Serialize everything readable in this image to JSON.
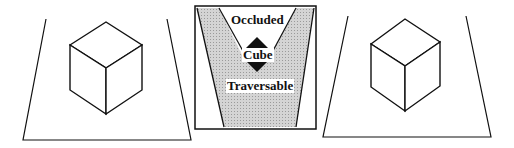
{
  "diagram": {
    "panels": [
      {
        "id": "left",
        "content": "cube-on-floor"
      },
      {
        "id": "middle",
        "content": "classification-map"
      },
      {
        "id": "right",
        "content": "cube-on-floor"
      }
    ],
    "middle": {
      "labels": {
        "occluded": "Occluded",
        "cube": "Cube",
        "traversable": "Traversable"
      },
      "colors": {
        "shaded": "#c8c8c8",
        "border": "#111111",
        "arrow": "#111111"
      }
    }
  }
}
